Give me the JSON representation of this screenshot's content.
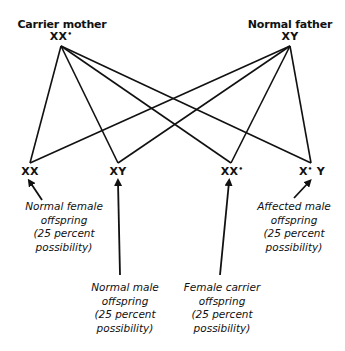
{
  "diagram": {
    "type": "X-linked inheritance cross",
    "line_color": "#111111",
    "parents": {
      "mother": {
        "label": "Carrier mother",
        "genotype_base": "XX",
        "genotype_mark": "•"
      },
      "father": {
        "label": "Normal father",
        "genotype_base": "XY",
        "genotype_mark": ""
      }
    },
    "offspring": [
      {
        "genotype_base": "XX",
        "genotype_mark": "",
        "genotype_tail": "",
        "caption": [
          "Normal female",
          "offspring",
          "(25 percent",
          "possibility)"
        ]
      },
      {
        "genotype_base": "XY",
        "genotype_mark": "",
        "genotype_tail": "",
        "caption": [
          "Normal male",
          "offspring",
          "(25 percent",
          "possibility)"
        ]
      },
      {
        "genotype_base": "XX",
        "genotype_mark": "•",
        "genotype_tail": "",
        "caption": [
          "Female carrier",
          "offspring",
          "(25 percent",
          "possibility)"
        ]
      },
      {
        "genotype_base": "X",
        "genotype_mark": "•",
        "genotype_tail": " Y",
        "caption": [
          "Affected male",
          "offspring",
          "(25 percent",
          "possibility)"
        ]
      }
    ]
  }
}
